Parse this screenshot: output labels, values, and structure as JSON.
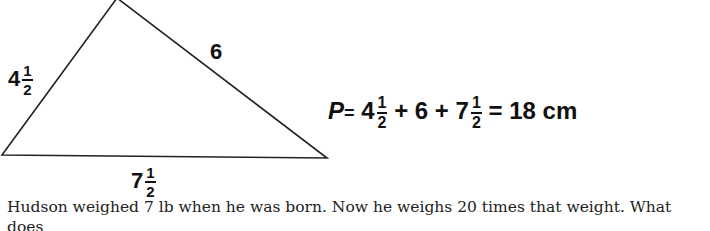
{
  "figure": {
    "shape": "triangle",
    "sides": {
      "left": {
        "whole": "4",
        "num": "1",
        "den": "2"
      },
      "right": {
        "whole": "6"
      },
      "base": {
        "whole": "7",
        "num": "1",
        "den": "2"
      }
    }
  },
  "formula": {
    "var": "P",
    "eq": "=",
    "t1_whole": "4",
    "t1_num": "1",
    "t1_den": "2",
    "plus1": "+",
    "t2": "6",
    "plus2": "+",
    "t3_whole": "7",
    "t3_num": "1",
    "t3_den": "2",
    "eq2": "=",
    "result": "18 cm"
  },
  "problem": {
    "line1": "Hudson weighed 7 lb when he was born. Now he weighs 20 times that weight. What does",
    "line2": "he weigh now? How much more does he weigh now than when he was born?"
  }
}
